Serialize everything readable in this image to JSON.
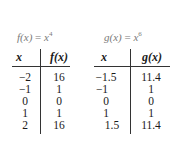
{
  "tables": [
    {
      "title_func": "f",
      "title_var": "x",
      "title_exp": "4",
      "header_x": "x",
      "header_fx": "f(x)",
      "x_values": [
        "−2",
        "−1",
        "0",
        "1",
        "2"
      ],
      "y_values": [
        "16",
        "1",
        "0",
        "1",
        "16"
      ]
    },
    {
      "title_func": "g",
      "title_var": "x",
      "title_exp": "6",
      "header_x": "x",
      "header_fx": "g(x)",
      "x_values": [
        "−1.5",
        "−1",
        "0",
        "1",
        "1.5"
      ],
      "y_values": [
        "11.4",
        "1",
        "0",
        "1",
        "11.4"
      ]
    }
  ]
}
